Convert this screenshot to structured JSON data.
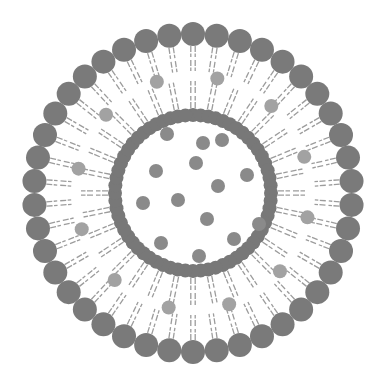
{
  "diagram": {
    "canvas": {
      "width": 386,
      "height": 386,
      "background": "#ffffff"
    },
    "center": [
      193,
      193
    ],
    "outer_layer": {
      "head_count": 42,
      "head_ring_radius": 159,
      "head_radius": 12,
      "head_color": "#7a7a7a"
    },
    "inner_layer": {
      "head_count": 64,
      "head_ring_radius": 78,
      "head_radius": 7,
      "head_color": "#787878"
    },
    "tails": {
      "color": "#9c9c9c",
      "pairs_per_lipid": 2,
      "gap_fraction": 0.5,
      "outer_start": 147,
      "outer_end": 122,
      "inner_start": 85,
      "inner_end": 112
    },
    "bilayer_molecules": {
      "color": "#a2a2a2",
      "radius": 7,
      "ring_radius": 117,
      "angles_deg": [
        12,
        42,
        72,
        102,
        132,
        162,
        192,
        222,
        252,
        282,
        312,
        342
      ]
    },
    "core_molecules": {
      "color": "#8a8a8a",
      "radius": 7,
      "points": [
        [
          167,
          134
        ],
        [
          203,
          143
        ],
        [
          222,
          140
        ],
        [
          156,
          171
        ],
        [
          196,
          163
        ],
        [
          247,
          175
        ],
        [
          218,
          186
        ],
        [
          143,
          203
        ],
        [
          178,
          200
        ],
        [
          207,
          219
        ],
        [
          259,
          224
        ],
        [
          161,
          243
        ],
        [
          234,
          239
        ],
        [
          199,
          256
        ]
      ]
    }
  }
}
